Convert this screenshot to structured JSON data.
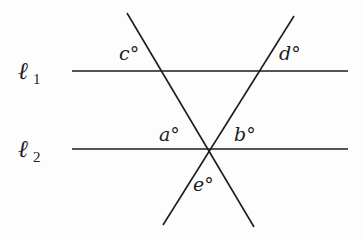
{
  "diagram": {
    "lines": [
      {
        "id": "l1",
        "name": "ℓ",
        "subscript": "1",
        "x1": 72,
        "y1": 71,
        "x2": 348,
        "y2": 71
      },
      {
        "id": "l2",
        "name": "ℓ",
        "subscript": "2",
        "x1": 72,
        "y1": 149,
        "x2": 348,
        "y2": 149
      },
      {
        "id": "t1",
        "name": "transversal-left",
        "x1": 127,
        "y1": 13,
        "x2": 254,
        "y2": 227
      },
      {
        "id": "t2",
        "name": "transversal-right",
        "x1": 294,
        "y1": 16,
        "x2": 163,
        "y2": 225
      }
    ],
    "angle_labels": {
      "a": "a°",
      "b": "b°",
      "c": "c°",
      "d": "d°",
      "e": "e°"
    },
    "line_labels": {
      "l1_name": "ℓ",
      "l1_sub": "1",
      "l2_name": "ℓ",
      "l2_sub": "2"
    },
    "colors": {
      "stroke": "#1c1c1c",
      "background": "#fdfdfd"
    }
  }
}
